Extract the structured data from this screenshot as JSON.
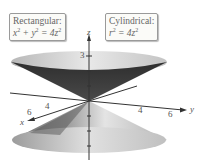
{
  "figure": {
    "rectangular_box": {
      "heading": "Rectangular:",
      "equation_parts": [
        "x",
        "2",
        " + y",
        "2",
        " = 4z",
        "2"
      ]
    },
    "cylindrical_box": {
      "heading": "Cylindrical:",
      "equation_parts": [
        "r",
        "2",
        " = 4z",
        "2"
      ]
    },
    "axes": {
      "z_label": "z",
      "x_label": "x",
      "y_label": "y",
      "z_tick_label": "3",
      "x_tick_labels": [
        "6",
        "4"
      ],
      "y_tick_labels": [
        "4",
        "6"
      ]
    },
    "colors": {
      "cone_dark": "#3a3a3a",
      "cone_mid": "#8a8a8a",
      "cone_light": "#e6e6e6",
      "axis": "#333333"
    }
  }
}
